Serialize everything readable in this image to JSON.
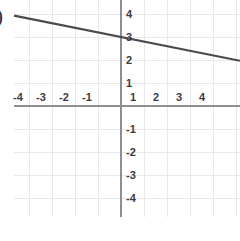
{
  "chart_data": {
    "type": "line",
    "title": "",
    "subtitle": "",
    "xlabel": "",
    "ylabel": "",
    "xlim": [
      -4.65,
      5.17
    ],
    "ylim": [
      -4.78,
      4.57
    ],
    "grid": true,
    "legend": null,
    "x_ticks": [
      -4,
      -3,
      -2,
      -1,
      1,
      2,
      3,
      4
    ],
    "y_ticks": [
      4,
      3,
      2,
      1,
      -1,
      -2,
      -3,
      -4
    ],
    "x_tick_labels": [
      "-4",
      "-3",
      "-2",
      "-1",
      "1",
      "2",
      "3",
      "4"
    ],
    "y_tick_labels": [
      "4",
      "3",
      "2",
      "1",
      "-1",
      "-2",
      "-3",
      "-4"
    ],
    "series": [
      {
        "name": "line",
        "equation": "y = -0.2x + 3",
        "slope": -0.2,
        "intercept": 3,
        "color": "#4a4a4f",
        "x": [
          -4.65,
          5.17
        ],
        "y": [
          3.93,
          1.97
        ]
      }
    ],
    "annotations": [
      {
        "name": "cut-off-parenthesis",
        "text": ")"
      }
    ]
  },
  "axes": {
    "x_axis_name": "x-axis",
    "y_axis_name": "y-axis",
    "axis_color": "#8e8e93",
    "grid_color": "#e9e9ec"
  },
  "colors": {
    "background": "#ffffff",
    "line": "#4a4a4f",
    "axis": "#8e8e93",
    "grid": "#e9e9ec",
    "label_text": "#3b3b3f"
  }
}
